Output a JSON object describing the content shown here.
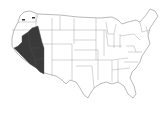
{
  "map": {
    "title": "",
    "subject": "United States (contiguous) outline map",
    "highlighted_region": {
      "label": "",
      "description": "Shaded region covering eastern California, Nevada, eastern Oregon, western Utah and western Arizona (Great Basin / desert southwest)",
      "fill_color": "#3a3a3a"
    },
    "base_fill": "#ffffff",
    "border_color": "#9a9a9a"
  }
}
